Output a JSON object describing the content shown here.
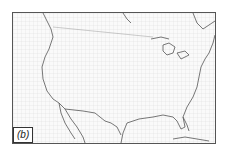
{
  "figure": {
    "panel_label": "(b)",
    "colors": {
      "frame": "#555555",
      "coast": "#555555",
      "grid": "#d8d8d8",
      "background": "#fafafa"
    }
  }
}
